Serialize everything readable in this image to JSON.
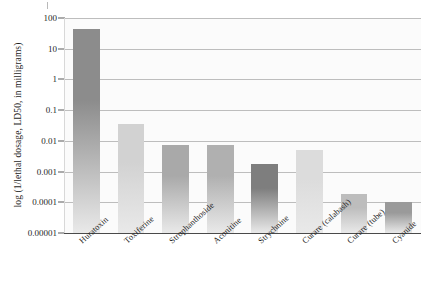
{
  "chart_data": {
    "type": "bar",
    "title": "",
    "xlabel": "",
    "ylabel": "log (1/lethal dosage, LD50, in milligrams)",
    "yscale": "log",
    "ylim": [
      1e-05,
      100
    ],
    "ytick_labels": [
      "100",
      "10",
      "1",
      "0.1",
      "0.01",
      "0.001",
      "0.0001",
      "0.00001"
    ],
    "ytick_values": [
      100,
      10,
      1,
      0.1,
      0.01,
      0.001,
      0.0001,
      1e-05
    ],
    "grid": true,
    "legend": "none",
    "categories": [
      "Huratoxin",
      "Toxiferine",
      "Strophanthoside",
      "Aconitine",
      "Strychnine",
      "Curare (calabash)",
      "Curare (tube)",
      "Cyanide"
    ],
    "values": [
      45,
      0.035,
      0.0075,
      0.0075,
      0.0018,
      0.005,
      0.00018,
      0.0001
    ],
    "bar_colors": [
      "#8c8c8c",
      "#d2d2d2",
      "#a9a9a9",
      "#b0b0b0",
      "#7e7e7e",
      "#dcdcdc",
      "#bdbdbd",
      "#9a9a9a"
    ]
  },
  "style": {
    "plot_background": "#fbfbfb",
    "gridline_color": "#bdbdbd",
    "axis_color": "#4a4a4a",
    "text_color": "#1f1f1f"
  }
}
